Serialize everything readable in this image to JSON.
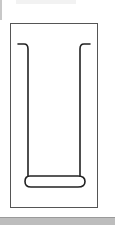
{
  "figure": {
    "frame_color": "#555555",
    "stroke_color": "#222222",
    "bottom_bar_color": "#bdbdbd"
  }
}
